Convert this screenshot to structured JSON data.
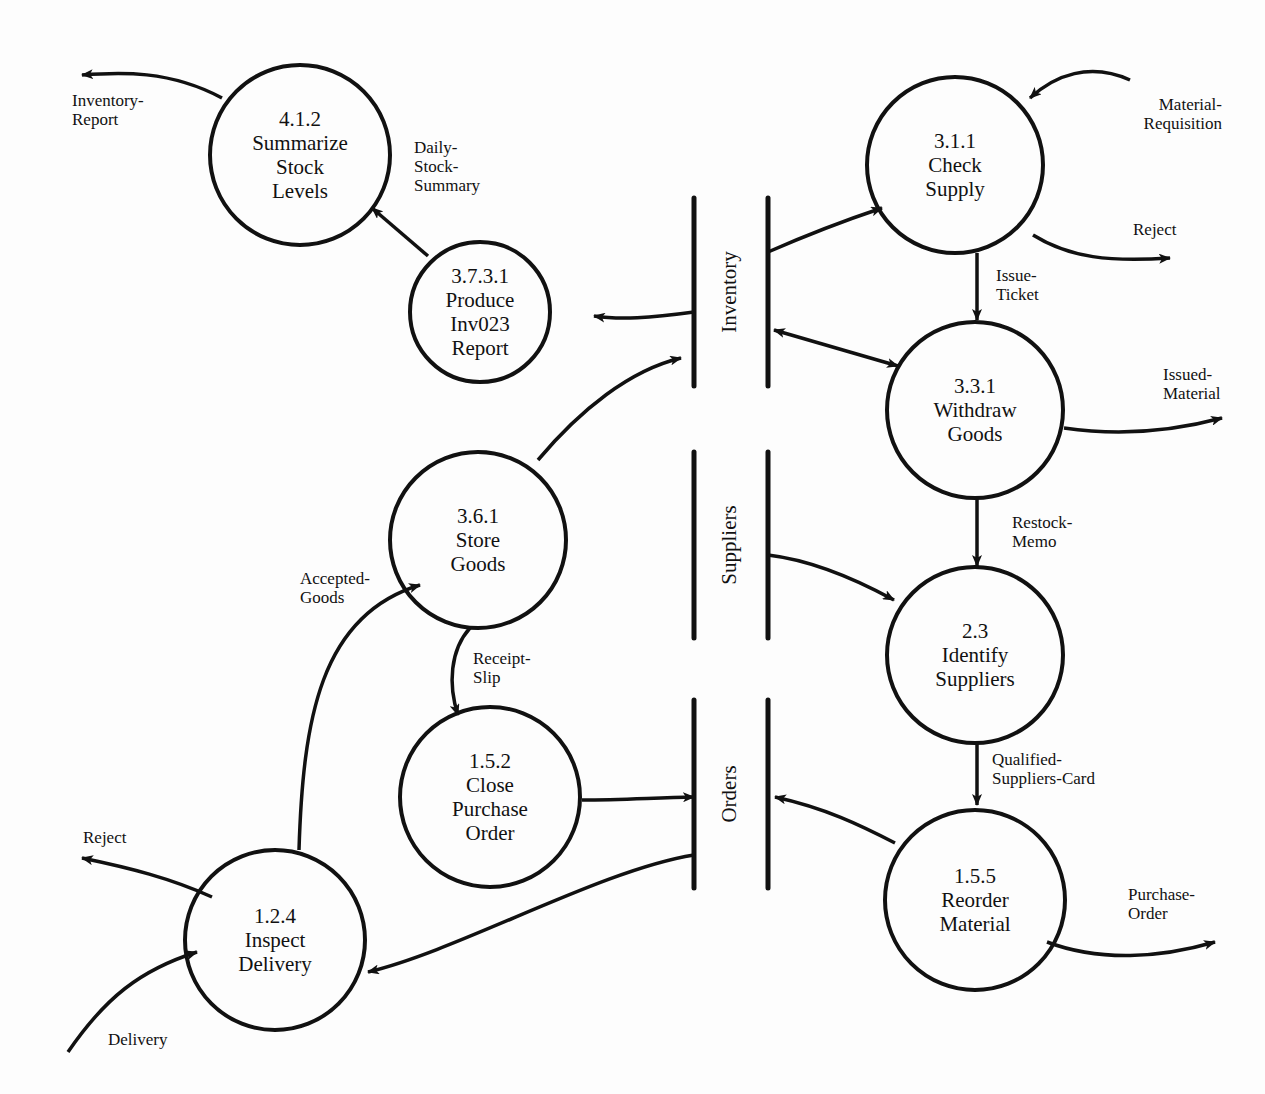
{
  "diagram": {
    "type": "data-flow-diagram",
    "colors": {
      "ink": "#111111",
      "paper": "#fdfdfd"
    },
    "processes": [
      {
        "id": "p412",
        "cx": 300,
        "cy": 155,
        "r": 90,
        "number": "4.1.2",
        "lines": [
          "Summarize",
          "Stock",
          "Levels"
        ]
      },
      {
        "id": "p3731",
        "cx": 480,
        "cy": 312,
        "r": 70,
        "number": "3.7.3.1",
        "lines": [
          "Produce",
          "Inv023",
          "Report"
        ]
      },
      {
        "id": "p361",
        "cx": 478,
        "cy": 540,
        "r": 88,
        "number": "3.6.1",
        "lines": [
          "Store",
          "Goods"
        ]
      },
      {
        "id": "p152",
        "cx": 490,
        "cy": 797,
        "r": 90,
        "number": "1.5.2",
        "lines": [
          "Close",
          "Purchase",
          "Order"
        ]
      },
      {
        "id": "p124",
        "cx": 275,
        "cy": 940,
        "r": 90,
        "number": "1.2.4",
        "lines": [
          "Inspect",
          "Delivery"
        ]
      },
      {
        "id": "p311",
        "cx": 955,
        "cy": 165,
        "r": 88,
        "number": "3.1.1",
        "lines": [
          "Check",
          "Supply"
        ]
      },
      {
        "id": "p331",
        "cx": 975,
        "cy": 410,
        "r": 88,
        "number": "3.3.1",
        "lines": [
          "Withdraw",
          "Goods"
        ]
      },
      {
        "id": "p23",
        "cx": 975,
        "cy": 655,
        "r": 88,
        "number": "2.3",
        "lines": [
          "Identify",
          "Suppliers"
        ]
      },
      {
        "id": "p155",
        "cx": 975,
        "cy": 900,
        "r": 90,
        "number": "1.5.5",
        "lines": [
          "Reorder",
          "Material"
        ]
      }
    ],
    "stores": [
      {
        "id": "s_inventory",
        "label": "Inventory",
        "x1": 694,
        "x2": 768,
        "y1": 198,
        "y2": 386
      },
      {
        "id": "s_suppliers",
        "label": "Suppliers",
        "x1": 694,
        "x2": 768,
        "y1": 452,
        "y2": 638
      },
      {
        "id": "s_orders",
        "label": "Orders",
        "x1": 694,
        "x2": 768,
        "y1": 700,
        "y2": 888
      }
    ],
    "flows": [
      {
        "label": [
          "Inventory-",
          "Report"
        ],
        "lx": 72,
        "ly": 106,
        "anchor": "start",
        "d": "M222,98 C170,70 120,72 82,75",
        "start_arrow": false,
        "end_arrow": true
      },
      {
        "label": [
          "Daily-",
          "Stock-",
          "Summary"
        ],
        "lx": 414,
        "ly": 153,
        "anchor": "start",
        "d": "M428,256 L372,208",
        "start_arrow": false,
        "end_arrow": true
      },
      {
        "label": [],
        "lx": 0,
        "ly": 0,
        "anchor": "start",
        "d": "M694,312 C650,318 620,320 594,316",
        "start_arrow": false,
        "end_arrow": true
      },
      {
        "label": [],
        "lx": 0,
        "ly": 0,
        "anchor": "start",
        "d": "M538,460 C580,410 630,370 681,358",
        "start_arrow": false,
        "end_arrow": true
      },
      {
        "label": [
          "Material-",
          "Requisition"
        ],
        "lx": 1222,
        "ly": 110,
        "anchor": "end",
        "d": "M1130,80 C1090,62 1055,75 1030,98",
        "start_arrow": false,
        "end_arrow": true
      },
      {
        "label": [],
        "lx": 0,
        "ly": 0,
        "anchor": "start",
        "d": "M768,252 C800,238 840,222 882,208",
        "start_arrow": false,
        "end_arrow": true
      },
      {
        "label": [
          "Reject"
        ],
        "lx": 1133,
        "ly": 235,
        "anchor": "start",
        "d": "M1033,235 C1070,258 1110,262 1170,258",
        "start_arrow": false,
        "end_arrow": true
      },
      {
        "label": [
          "Issue-",
          "Ticket"
        ],
        "lx": 996,
        "ly": 281,
        "anchor": "start",
        "d": "M977,253 L977,320",
        "start_arrow": false,
        "end_arrow": true
      },
      {
        "label": [],
        "lx": 0,
        "ly": 0,
        "anchor": "start",
        "d": "M774,330 L898,366",
        "start_arrow": true,
        "end_arrow": true
      },
      {
        "label": [
          "Issued-",
          "Material"
        ],
        "lx": 1163,
        "ly": 380,
        "anchor": "start",
        "d": "M1064,428 C1120,436 1170,432 1222,418",
        "start_arrow": false,
        "end_arrow": true
      },
      {
        "label": [
          "Restock-",
          "Memo"
        ],
        "lx": 1012,
        "ly": 528,
        "anchor": "start",
        "d": "M977,498 L977,566",
        "start_arrow": false,
        "end_arrow": true
      },
      {
        "label": [],
        "lx": 0,
        "ly": 0,
        "anchor": "start",
        "d": "M768,555 C810,560 850,576 894,600",
        "start_arrow": false,
        "end_arrow": true
      },
      {
        "label": [
          "Qualified-",
          "Suppliers-Card"
        ],
        "lx": 992,
        "ly": 765,
        "anchor": "start",
        "d": "M977,743 L977,805",
        "start_arrow": false,
        "end_arrow": true
      },
      {
        "label": [],
        "lx": 0,
        "ly": 0,
        "anchor": "start",
        "d": "M895,843 C860,825 825,808 775,797",
        "start_arrow": false,
        "end_arrow": true
      },
      {
        "label": [
          "Purchase-",
          "Order"
        ],
        "lx": 1128,
        "ly": 900,
        "anchor": "start",
        "d": "M1047,942 C1100,962 1160,958 1215,942",
        "start_arrow": false,
        "end_arrow": true
      },
      {
        "label": [
          "Receipt-",
          "Slip"
        ],
        "lx": 473,
        "ly": 664,
        "anchor": "start",
        "d": "M470,628 C450,650 448,685 458,715",
        "start_arrow": false,
        "end_arrow": true
      },
      {
        "label": [],
        "lx": 0,
        "ly": 0,
        "anchor": "start",
        "d": "M582,800 C620,800 650,798 694,797",
        "start_arrow": false,
        "end_arrow": true
      },
      {
        "label": [
          "Accepted-",
          "Goods"
        ],
        "lx": 300,
        "ly": 584,
        "anchor": "start",
        "d": "M299,850 C303,720 320,615 420,585",
        "start_arrow": false,
        "end_arrow": true
      },
      {
        "label": [
          "Reject"
        ],
        "lx": 83,
        "ly": 843,
        "anchor": "start",
        "d": "M212,897 C170,878 130,868 82,858",
        "start_arrow": false,
        "end_arrow": true
      },
      {
        "label": [
          "Delivery"
        ],
        "lx": 108,
        "ly": 1045,
        "anchor": "start",
        "d": "M68,1052 C105,998 140,970 197,952",
        "start_arrow": false,
        "end_arrow": true
      },
      {
        "label": [],
        "lx": 0,
        "ly": 0,
        "anchor": "start",
        "d": "M694,855 C600,870 460,950 368,972",
        "start_arrow": false,
        "end_arrow": true
      }
    ]
  }
}
